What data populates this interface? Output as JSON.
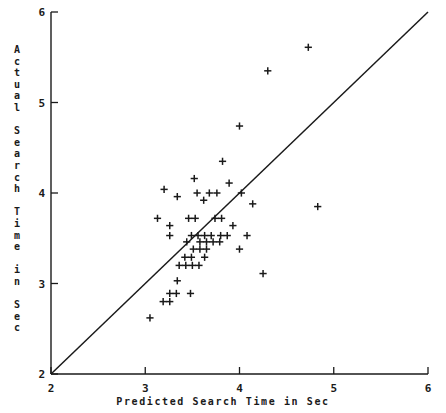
{
  "chart_data": {
    "type": "scatter",
    "title": "",
    "xlabel": "Predicted Search Time in Sec",
    "ylabel": "Actual Search Time in Sec",
    "xlim": [
      2,
      6
    ],
    "ylim": [
      2,
      6
    ],
    "xticks": [
      "2",
      "3",
      "4",
      "5",
      "6"
    ],
    "yticks": [
      "2",
      "3",
      "4",
      "5",
      "6"
    ],
    "xtick_values": [
      2,
      3,
      4,
      5,
      6
    ],
    "ytick_values": [
      2,
      3,
      4,
      5,
      6
    ],
    "grid": false,
    "legend": "none",
    "marker": "+",
    "marker_color": "#1a1a1a",
    "reference_line": {
      "name": "identity-line",
      "description": "y = x",
      "from": [
        2,
        2
      ],
      "to": [
        6,
        6
      ],
      "color": "#1a1a1a"
    },
    "points": [
      [
        4.73,
        5.61
      ],
      [
        4.3,
        5.35
      ],
      [
        4.0,
        4.74
      ],
      [
        3.82,
        4.35
      ],
      [
        3.52,
        4.16
      ],
      [
        3.89,
        4.11
      ],
      [
        3.2,
        4.04
      ],
      [
        3.55,
        4.0
      ],
      [
        3.68,
        4.0
      ],
      [
        3.76,
        4.0
      ],
      [
        4.02,
        4.0
      ],
      [
        3.34,
        3.96
      ],
      [
        3.62,
        3.92
      ],
      [
        4.14,
        3.88
      ],
      [
        4.83,
        3.85
      ],
      [
        3.13,
        3.72
      ],
      [
        3.46,
        3.72
      ],
      [
        3.53,
        3.72
      ],
      [
        3.74,
        3.72
      ],
      [
        3.81,
        3.72
      ],
      [
        3.26,
        3.64
      ],
      [
        3.93,
        3.64
      ],
      [
        3.26,
        3.53
      ],
      [
        3.49,
        3.53
      ],
      [
        3.56,
        3.53
      ],
      [
        3.63,
        3.53
      ],
      [
        3.7,
        3.53
      ],
      [
        3.8,
        3.53
      ],
      [
        3.87,
        3.53
      ],
      [
        4.08,
        3.53
      ],
      [
        3.44,
        3.46
      ],
      [
        3.58,
        3.46
      ],
      [
        3.65,
        3.46
      ],
      [
        3.72,
        3.46
      ],
      [
        3.79,
        3.46
      ],
      [
        3.51,
        3.38
      ],
      [
        3.58,
        3.38
      ],
      [
        3.65,
        3.38
      ],
      [
        4.0,
        3.38
      ],
      [
        3.42,
        3.29
      ],
      [
        3.49,
        3.29
      ],
      [
        3.63,
        3.29
      ],
      [
        3.36,
        3.2
      ],
      [
        3.43,
        3.2
      ],
      [
        3.5,
        3.2
      ],
      [
        3.57,
        3.2
      ],
      [
        4.25,
        3.11
      ],
      [
        3.34,
        3.03
      ],
      [
        3.26,
        2.89
      ],
      [
        3.33,
        2.89
      ],
      [
        3.48,
        2.89
      ],
      [
        3.19,
        2.8
      ],
      [
        3.26,
        2.8
      ],
      [
        3.05,
        2.62
      ]
    ]
  },
  "axis": {
    "x_tick_labels": [
      "2",
      "3",
      "4",
      "5",
      "6"
    ],
    "y_tick_labels": [
      "2",
      "3",
      "4",
      "5",
      "6"
    ],
    "x_title": "Predicted Search Time in Sec",
    "y_title_chars": [
      "A",
      "c",
      "t",
      "u",
      "a",
      "l",
      "",
      "S",
      "e",
      "a",
      "r",
      "c",
      "h",
      "",
      "T",
      "i",
      "m",
      "e",
      "",
      "i",
      "n",
      "",
      "S",
      "e",
      "c"
    ]
  }
}
